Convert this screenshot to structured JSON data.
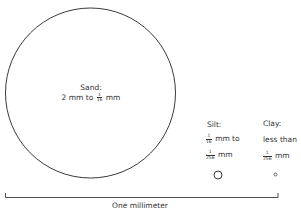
{
  "diagram": {
    "sand": {
      "title": "Sand:",
      "range_prefix": "2 mm to",
      "frac_num": "1",
      "frac_den": "16",
      "unit": "mm"
    },
    "silt": {
      "title": "Silt:",
      "from_num": "1",
      "from_den": "16",
      "from_suffix": "mm to",
      "to_num": "1",
      "to_den": "256",
      "to_suffix": "mm"
    },
    "clay": {
      "title": "Clay:",
      "line1": "less than",
      "frac_num": "1",
      "frac_den": "256",
      "unit": "mm"
    },
    "scale_bar": {
      "label": "One millimeter"
    },
    "colors": {
      "stroke": "#3a3a3a",
      "background": "#ffffff"
    }
  }
}
